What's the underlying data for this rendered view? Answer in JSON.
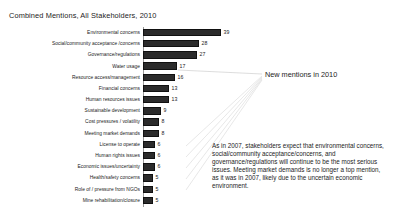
{
  "chart_data": {
    "type": "bar",
    "orientation": "horizontal",
    "title": "Combined Mentions, All Stakeholders, 2010",
    "xlabel": "",
    "ylabel": "",
    "grid": false,
    "legend": "none",
    "xlim": [
      0,
      40
    ],
    "categories": [
      "Environmental concerns",
      "Social/community acceptance /concerns",
      "Governance/regulations",
      "Water usage",
      "Resource access/management",
      "Financial concerns",
      "Human resources issues",
      "Sustainable development",
      "Cost pressures / volatility",
      "Meeting market demands",
      "License to operate",
      "Human rights issues",
      "Economic issues/uncertainty",
      "Health/safety concerns",
      "Role of / pressure from NGOs",
      "Mine rehabilitation/closure"
    ],
    "values": [
      39,
      28,
      27,
      17,
      16,
      13,
      13,
      9,
      8,
      8,
      6,
      6,
      6,
      5,
      5,
      5
    ],
    "bar_color": "#2b2b2b"
  },
  "annotations": {
    "callout_label": "New mentions in 2010",
    "body_note": "As in 2007, stakeholders expect that environmental concerns, social/community acceptance/concerns, and governance/regulations will continue to be the most serious issues. Meeting market demands is no longer a top mention, as it was in 2007, likely due to the uncertain economic environment."
  }
}
